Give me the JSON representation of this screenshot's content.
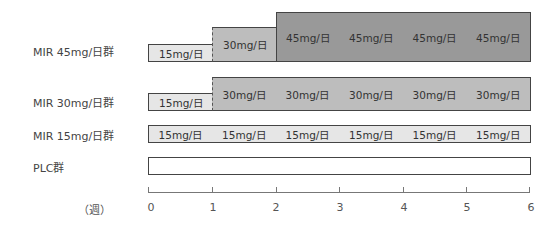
{
  "diagram": {
    "axis": {
      "unit": "（週）",
      "ticks": [
        "0",
        "1",
        "2",
        "3",
        "4",
        "5",
        "6"
      ]
    },
    "colors": {
      "dose_15": "#e6e6e6",
      "dose_30": "#bdbdbd",
      "dose_45": "#999999",
      "placebo": "#ffffff",
      "border": "#444444"
    },
    "groups": [
      {
        "label": "MIR 45mg/日群",
        "segments": [
          {
            "week_start": 0,
            "week_end": 1,
            "dose": "15mg/日"
          },
          {
            "week_start": 1,
            "week_end": 2,
            "dose": "30mg/日"
          },
          {
            "week_start": 2,
            "week_end": 3,
            "dose": "45mg/日"
          },
          {
            "week_start": 3,
            "week_end": 4,
            "dose": "45mg/日"
          },
          {
            "week_start": 4,
            "week_end": 5,
            "dose": "45mg/日"
          },
          {
            "week_start": 5,
            "week_end": 6,
            "dose": "45mg/日"
          }
        ]
      },
      {
        "label": "MIR 30mg/日群",
        "segments": [
          {
            "week_start": 0,
            "week_end": 1,
            "dose": "15mg/日"
          },
          {
            "week_start": 1,
            "week_end": 2,
            "dose": "30mg/日"
          },
          {
            "week_start": 2,
            "week_end": 3,
            "dose": "30mg/日"
          },
          {
            "week_start": 3,
            "week_end": 4,
            "dose": "30mg/日"
          },
          {
            "week_start": 4,
            "week_end": 5,
            "dose": "30mg/日"
          },
          {
            "week_start": 5,
            "week_end": 6,
            "dose": "30mg/日"
          }
        ]
      },
      {
        "label": "MIR 15mg/日群",
        "segments": [
          {
            "week_start": 0,
            "week_end": 1,
            "dose": "15mg/日"
          },
          {
            "week_start": 1,
            "week_end": 2,
            "dose": "15mg/日"
          },
          {
            "week_start": 2,
            "week_end": 3,
            "dose": "15mg/日"
          },
          {
            "week_start": 3,
            "week_end": 4,
            "dose": "15mg/日"
          },
          {
            "week_start": 4,
            "week_end": 5,
            "dose": "15mg/日"
          },
          {
            "week_start": 5,
            "week_end": 6,
            "dose": "15mg/日"
          }
        ]
      },
      {
        "label": "PLC群",
        "segments": [
          {
            "week_start": 0,
            "week_end": 1,
            "dose": ""
          },
          {
            "week_start": 1,
            "week_end": 2,
            "dose": ""
          },
          {
            "week_start": 2,
            "week_end": 3,
            "dose": ""
          },
          {
            "week_start": 3,
            "week_end": 4,
            "dose": ""
          },
          {
            "week_start": 4,
            "week_end": 5,
            "dose": ""
          },
          {
            "week_start": 5,
            "week_end": 6,
            "dose": ""
          }
        ]
      }
    ]
  }
}
